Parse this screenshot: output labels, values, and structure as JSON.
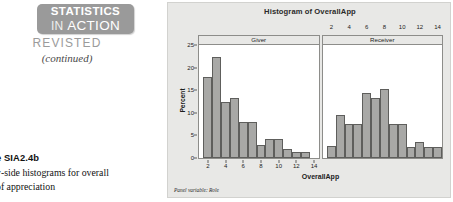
{
  "sidebar": {
    "badge_line1": "STATISTICS",
    "badge_line2_small": "IN ",
    "badge_line2_big": "ACTION",
    "revisited": "REVISTED",
    "continued": "(continued)",
    "caption_head": "e SIA2.4b",
    "caption_line1": "y-side histograms for overall",
    "caption_line2": "of appreciation"
  },
  "figure": {
    "title": "Histogram of OverallApp",
    "panel_variable_note": "Panel variable: Role",
    "bar_fill": "#a8a8a6",
    "bar_edge": "#5e5e5c",
    "figure_background": "#e8e8e6",
    "plot_background": "#ffffff"
  },
  "chart_data": {
    "type": "bar",
    "title": "Histogram of OverallApp",
    "xlabel": "OverallApp",
    "ylabel": "Percent",
    "ylim": [
      0,
      25
    ],
    "yticks": [
      0,
      5,
      10,
      15,
      20,
      25
    ],
    "xlim": [
      1,
      14.5
    ],
    "xticks": [
      2,
      4,
      6,
      8,
      10,
      12,
      14
    ],
    "grid": false,
    "legend": "none",
    "panel_variable": "Role",
    "bin_width": 1,
    "panels": [
      {
        "name": "Giver",
        "axis_position": "bottom",
        "x": [
          2,
          3,
          4,
          5,
          6,
          7,
          8,
          9,
          10,
          11,
          12,
          13
        ],
        "values": [
          18.0,
          22.3,
          12.5,
          13.3,
          8.0,
          8.0,
          2.8,
          4.3,
          4.3,
          2.0,
          1.3,
          1.3
        ]
      },
      {
        "name": "Receiver",
        "axis_position": "top",
        "x": [
          2,
          3,
          4,
          5,
          6,
          7,
          8,
          9,
          10,
          11,
          12,
          13,
          14
        ],
        "values": [
          2.7,
          9.5,
          7.5,
          7.5,
          14.3,
          13.3,
          15.3,
          7.5,
          7.5,
          2.5,
          3.6,
          2.5,
          2.5
        ]
      }
    ]
  }
}
